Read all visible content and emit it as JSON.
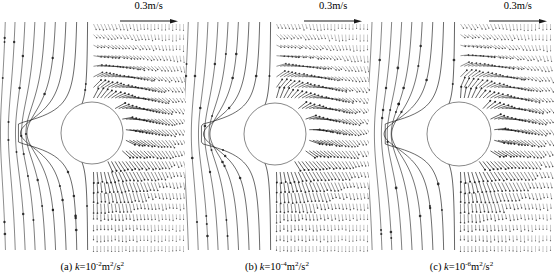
{
  "figure": {
    "type": "vector-field-panels",
    "panel_count": 3,
    "background_color": "#ffffff",
    "line_color": "#1a1a1a"
  },
  "scale_legend": {
    "label": "0.3m/s",
    "value": 0.3,
    "unit": "m/s",
    "arrow_direction": "right",
    "icon": "arrow-right-icon"
  },
  "panels": [
    {
      "id": "a",
      "caption_prefix": "(a)",
      "caption_symbol": "k",
      "caption_equals": "=10",
      "caption_exponent": "-2",
      "caption_units_m": "m",
      "caption_units_m_exp": "2",
      "caption_units_s": "/s",
      "caption_units_s_exp": "2",
      "caption_full": "(a) k=10-2m2/s2",
      "k_value": "1e-2",
      "scale_label": "0.3m/s",
      "obstacle": {
        "shape": "circle",
        "cx": 92,
        "cy": 113,
        "r": 31
      },
      "left_field": {
        "style": "streamlines",
        "count": 9,
        "x_start": 8,
        "x_end": 88,
        "marker": "dot"
      },
      "right_field": {
        "style": "dense-vectors",
        "columns": 26,
        "rows": 22,
        "x_start": 92,
        "x_end": 182,
        "spread": 0.92
      }
    },
    {
      "id": "b",
      "caption_prefix": "(b)",
      "caption_symbol": "k",
      "caption_equals": "=10",
      "caption_exponent": "-4",
      "caption_units_m": "m",
      "caption_units_m_exp": "2",
      "caption_units_s": "/s",
      "caption_units_s_exp": "2",
      "caption_full": "(b) k=10-4m2/s2",
      "k_value": "1e-4",
      "scale_label": "0.3m/s",
      "obstacle": {
        "shape": "circle",
        "cx": 90,
        "cy": 114,
        "r": 31
      },
      "left_field": {
        "style": "streamlines",
        "count": 9,
        "x_start": 6,
        "x_end": 86,
        "marker": "dot"
      },
      "right_field": {
        "style": "dense-vectors",
        "columns": 26,
        "rows": 22,
        "x_start": 90,
        "x_end": 181,
        "spread": 1.0
      }
    },
    {
      "id": "c",
      "caption_prefix": "(c)",
      "caption_symbol": "k",
      "caption_equals": "=10",
      "caption_exponent": "-6",
      "caption_units_m": "m",
      "caption_units_m_exp": "2",
      "caption_units_s": "/s",
      "caption_units_s_exp": "2",
      "caption_full": "(c) k=10-6m2/s2",
      "k_value": "1e-6",
      "scale_label": "0.3m/s",
      "obstacle": {
        "shape": "circle",
        "cx": 90,
        "cy": 114,
        "r": 32
      },
      "left_field": {
        "style": "streamlines",
        "count": 9,
        "x_start": 6,
        "x_end": 86,
        "marker": "dot"
      },
      "right_field": {
        "style": "dense-vectors",
        "columns": 25,
        "rows": 22,
        "x_start": 90,
        "x_end": 180,
        "spread": 1.06
      }
    }
  ],
  "chart_data": {
    "type": "vector-field",
    "title": "",
    "subtitle": "",
    "xlabel": "",
    "ylabel": "",
    "legend": [
      "0.3m/s"
    ],
    "legend_position": "top-right",
    "grid": false,
    "annotations": [
      "(a) k=10-2m2/s2",
      "(b) k=10-4m2/s2",
      "(c) k=10-6m2/s2"
    ],
    "series": [
      {
        "name": "(a) k=1e-2 m2/s2",
        "flow_direction": "downward",
        "obstacle": "circle",
        "left_region": "streamlines",
        "right_region": "dense-vectors"
      },
      {
        "name": "(b) k=1e-4 m2/s2",
        "flow_direction": "downward",
        "obstacle": "circle",
        "left_region": "streamlines",
        "right_region": "dense-vectors"
      },
      {
        "name": "(c) k=1e-6 m2/s2",
        "flow_direction": "downward",
        "obstacle": "circle",
        "left_region": "streamlines",
        "right_region": "dense-vectors"
      }
    ]
  }
}
